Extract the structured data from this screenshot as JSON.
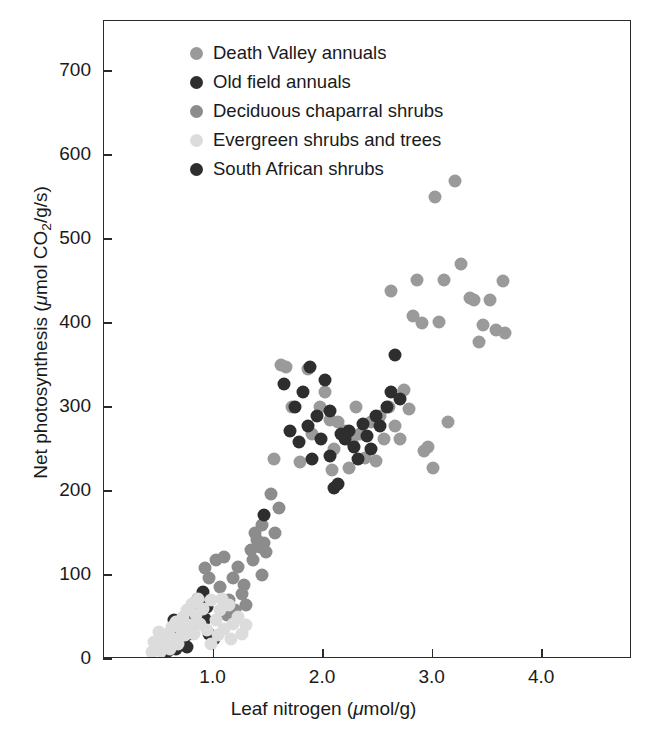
{
  "chart_data": {
    "type": "scatter",
    "title": "",
    "xlabel": "Leaf nitrogen (μmol/g)",
    "ylabel": "Net photosynthesis (μmol CO₂/g/s)",
    "xlabel_parts": {
      "pre": "Leaf nitrogen (",
      "mu": "μ",
      "post": "mol/g)"
    },
    "ylabel_parts": {
      "pre": "Net photosynthesis (",
      "mu": "μ",
      "mid": "mol CO",
      "sub": "2",
      "post": "/g/s)"
    },
    "xlim": [
      0.0,
      4.82
    ],
    "ylim": [
      0,
      760
    ],
    "xticks": [
      1.0,
      2.0,
      3.0,
      4.0
    ],
    "xticklabels": [
      "1.0",
      "2.0",
      "3.0",
      "4.0"
    ],
    "yticks": [
      0,
      100,
      200,
      300,
      400,
      500,
      600,
      700
    ],
    "yticklabels": [
      "0",
      "100",
      "200",
      "300",
      "400",
      "500",
      "600",
      "700"
    ],
    "grid": false,
    "legend_position": "upper-left-inside",
    "marker_size_px": 13,
    "series": [
      {
        "name": "Death Valley annuals",
        "color": "#9a9a9a",
        "points": [
          [
            1.62,
            350
          ],
          [
            1.66,
            348
          ],
          [
            1.72,
            300
          ],
          [
            1.79,
            235
          ],
          [
            1.86,
            345
          ],
          [
            1.9,
            268
          ],
          [
            1.97,
            300
          ],
          [
            2.02,
            318
          ],
          [
            2.06,
            285
          ],
          [
            2.1,
            250
          ],
          [
            2.14,
            282
          ],
          [
            2.2,
            272
          ],
          [
            2.26,
            258
          ],
          [
            2.3,
            300
          ],
          [
            2.34,
            268
          ],
          [
            2.38,
            240
          ],
          [
            2.44,
            282
          ],
          [
            2.48,
            236
          ],
          [
            2.52,
            290
          ],
          [
            2.56,
            262
          ],
          [
            2.6,
            300
          ],
          [
            2.62,
            438
          ],
          [
            2.66,
            278
          ],
          [
            2.7,
            262
          ],
          [
            2.74,
            320
          ],
          [
            2.78,
            298
          ],
          [
            2.82,
            408
          ],
          [
            2.86,
            452
          ],
          [
            2.9,
            400
          ],
          [
            2.92,
            248
          ],
          [
            2.96,
            252
          ],
          [
            3.0,
            228
          ],
          [
            3.02,
            550
          ],
          [
            3.06,
            402
          ],
          [
            3.1,
            452
          ],
          [
            3.14,
            282
          ],
          [
            3.2,
            570
          ],
          [
            3.26,
            470
          ],
          [
            3.34,
            430
          ],
          [
            3.38,
            428
          ],
          [
            3.42,
            378
          ],
          [
            3.46,
            398
          ],
          [
            3.52,
            428
          ],
          [
            3.58,
            392
          ],
          [
            3.64,
            450
          ],
          [
            3.66,
            388
          ],
          [
            2.24,
            228
          ],
          [
            2.08,
            225
          ],
          [
            1.55,
            238
          ]
        ]
      },
      {
        "name": "Old field annuals",
        "color": "#2e2e2e",
        "points": [
          [
            0.62,
            18
          ],
          [
            0.66,
            12
          ],
          [
            0.68,
            26
          ],
          [
            0.7,
            34
          ],
          [
            0.72,
            20
          ],
          [
            0.74,
            40
          ],
          [
            0.76,
            14
          ],
          [
            0.78,
            30
          ],
          [
            0.8,
            52
          ],
          [
            0.82,
            66
          ],
          [
            0.84,
            44
          ],
          [
            0.86,
            72
          ],
          [
            0.88,
            58
          ],
          [
            0.9,
            80
          ],
          [
            0.94,
            62
          ],
          [
            0.96,
            30
          ],
          [
            1.0,
            24
          ],
          [
            0.58,
            10
          ],
          [
            0.64,
            46
          ],
          [
            0.92,
            48
          ]
        ]
      },
      {
        "name": "Deciduous chaparral shrubs",
        "color": "#8c8c8c",
        "points": [
          [
            0.92,
            108
          ],
          [
            0.96,
            96
          ],
          [
            1.02,
            118
          ],
          [
            1.06,
            86
          ],
          [
            1.1,
            122
          ],
          [
            1.14,
            70
          ],
          [
            1.18,
            96
          ],
          [
            1.22,
            110
          ],
          [
            1.26,
            78
          ],
          [
            1.3,
            64
          ],
          [
            1.34,
            130
          ],
          [
            1.38,
            150
          ],
          [
            1.4,
            142
          ],
          [
            1.42,
            134
          ],
          [
            1.44,
            160
          ],
          [
            1.46,
            138
          ],
          [
            1.48,
            128
          ],
          [
            1.52,
            196
          ],
          [
            1.56,
            150
          ],
          [
            1.6,
            180
          ],
          [
            1.36,
            118
          ],
          [
            1.28,
            88
          ],
          [
            1.2,
            58
          ],
          [
            1.12,
            52
          ],
          [
            1.44,
            100
          ]
        ]
      },
      {
        "name": "Evergreen shrubs and trees",
        "color": "#dcdcdc",
        "points": [
          [
            0.44,
            8
          ],
          [
            0.48,
            14
          ],
          [
            0.52,
            10
          ],
          [
            0.54,
            22
          ],
          [
            0.56,
            16
          ],
          [
            0.58,
            30
          ],
          [
            0.6,
            12
          ],
          [
            0.62,
            38
          ],
          [
            0.64,
            24
          ],
          [
            0.66,
            44
          ],
          [
            0.68,
            18
          ],
          [
            0.7,
            36
          ],
          [
            0.72,
            50
          ],
          [
            0.74,
            28
          ],
          [
            0.76,
            58
          ],
          [
            0.78,
            40
          ],
          [
            0.8,
            66
          ],
          [
            0.82,
            30
          ],
          [
            0.84,
            52
          ],
          [
            0.86,
            72
          ],
          [
            0.88,
            42
          ],
          [
            0.9,
            60
          ],
          [
            0.94,
            34
          ],
          [
            0.98,
            70
          ],
          [
            1.02,
            46
          ],
          [
            1.06,
            58
          ],
          [
            1.1,
            36
          ],
          [
            1.14,
            64
          ],
          [
            1.18,
            42
          ],
          [
            1.22,
            50
          ],
          [
            1.26,
            30
          ],
          [
            1.04,
            28
          ],
          [
            0.5,
            32
          ],
          [
            0.46,
            20
          ],
          [
            1.08,
            72
          ],
          [
            1.16,
            24
          ],
          [
            0.98,
            18
          ],
          [
            1.3,
            40
          ]
        ]
      },
      {
        "name": "South African shrubs",
        "color": "#2e2e2e",
        "points": [
          [
            1.46,
            172
          ],
          [
            1.64,
            328
          ],
          [
            1.7,
            272
          ],
          [
            1.74,
            300
          ],
          [
            1.78,
            258
          ],
          [
            1.82,
            318
          ],
          [
            1.86,
            278
          ],
          [
            1.9,
            238
          ],
          [
            1.94,
            290
          ],
          [
            1.98,
            262
          ],
          [
            2.02,
            332
          ],
          [
            2.06,
            242
          ],
          [
            2.1,
            204
          ],
          [
            2.14,
            208
          ],
          [
            2.16,
            268
          ],
          [
            2.2,
            262
          ],
          [
            2.24,
            272
          ],
          [
            2.28,
            252
          ],
          [
            2.32,
            238
          ],
          [
            2.36,
            280
          ],
          [
            2.4,
            266
          ],
          [
            2.44,
            250
          ],
          [
            2.48,
            290
          ],
          [
            2.52,
            278
          ],
          [
            2.58,
            300
          ],
          [
            2.62,
            318
          ],
          [
            2.66,
            362
          ],
          [
            2.7,
            310
          ],
          [
            2.06,
            295
          ],
          [
            1.88,
            348
          ]
        ]
      }
    ]
  },
  "legend": {
    "entries": [
      {
        "label": "Death Valley annuals",
        "color": "#9a9a9a"
      },
      {
        "label": "Old field annuals",
        "color": "#2e2e2e"
      },
      {
        "label": "Deciduous chaparral shrubs",
        "color": "#8c8c8c"
      },
      {
        "label": "Evergreen shrubs and trees",
        "color": "#dcdcdc"
      },
      {
        "label": "South African shrubs",
        "color": "#2e2e2e"
      }
    ]
  },
  "axes": {
    "frame_color": "#2b2b2b"
  }
}
